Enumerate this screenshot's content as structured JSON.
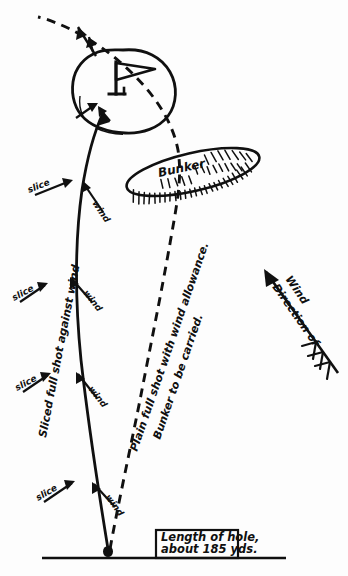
{
  "figure": {
    "ink_color": "#101010",
    "paper_color": "#fdfdfd"
  },
  "green": {
    "name": "putting-green",
    "flag_label": "flag"
  },
  "bunker": {
    "label": "Bunker"
  },
  "trajectories": {
    "solid": {
      "name": "sliced-shot-path",
      "label": "Sliced full shot against wind"
    },
    "dashed": {
      "name": "plain-shot-path",
      "label_line1": "Plain full shot with wind allowance.",
      "label_line2": "Bunker to be carried."
    }
  },
  "wind": {
    "direction_label_line1": "Direction of",
    "direction_label_line2": "Wind"
  },
  "annotations": {
    "slice_1": "slice",
    "wind_1": "wind",
    "slice_2": "slice",
    "wind_2": "wind",
    "slice_3": "slice",
    "wind_3": "wind"
  },
  "hole_info": {
    "line1": "Length of hole,",
    "line2": "about 185 yds."
  }
}
